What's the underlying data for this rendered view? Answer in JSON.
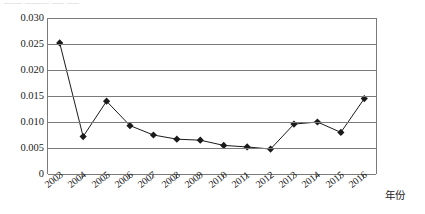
{
  "top_artifact": {
    "text": "───  ──── ── ──"
  },
  "chart_data": {
    "type": "line",
    "title": "",
    "xlabel": "年份",
    "ylabel": "",
    "categories": [
      "2003",
      "2004",
      "2005",
      "2006",
      "2007",
      "2008",
      "2009",
      "2010",
      "2011",
      "2012",
      "2013",
      "2014",
      "2015",
      "2016"
    ],
    "values": [
      0.0252,
      0.0072,
      0.014,
      0.0093,
      0.0075,
      0.0067,
      0.0065,
      0.0055,
      0.0052,
      0.0048,
      0.0096,
      0.01,
      0.008,
      0.0145
    ],
    "ylim": [
      0,
      0.03
    ],
    "yticks": [
      0,
      0.005,
      0.01,
      0.015,
      0.02,
      0.025,
      0.03
    ],
    "ytick_labels": [
      "0",
      "0.005",
      "0.010",
      "0.015",
      "0.020",
      "0.025",
      "0.030"
    ],
    "grid": true,
    "legend": "none",
    "marker": "diamond",
    "series_color": "#1a1a1a",
    "grid_color": "#7a7a7a"
  }
}
